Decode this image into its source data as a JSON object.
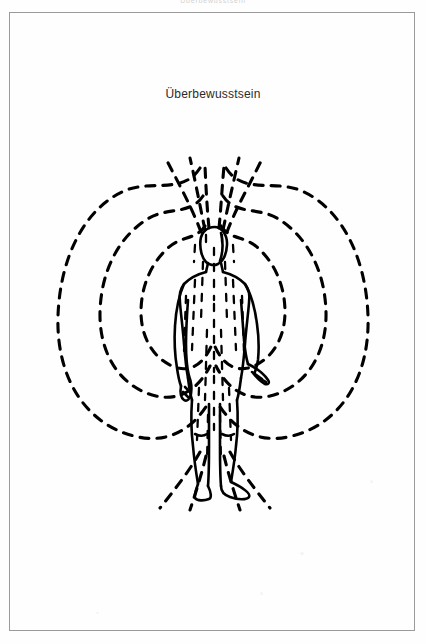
{
  "page": {
    "running_head": "Überbewusstsein",
    "background_color": "#fefefe",
    "frame_color": "#9a9a9a",
    "ink_color": "#000000"
  },
  "illustration": {
    "caption": "Überbewusstsein",
    "caption_color": "#2b2b2b",
    "subject": "standing-human-figure",
    "field_type": "toroidal-energy-field",
    "line_style": "dashed",
    "elements": [
      {
        "name": "human-figure",
        "description": "front-facing standing nude figure, arms at sides"
      },
      {
        "name": "aura-loop-inner-left",
        "description": "innermost dashed field loop, left side"
      },
      {
        "name": "aura-loop-middle-left",
        "description": "middle dashed field loop, left side"
      },
      {
        "name": "aura-loop-outer-left",
        "description": "outermost dashed field loop, left side"
      },
      {
        "name": "aura-loop-inner-right",
        "description": "innermost dashed field loop, right side"
      },
      {
        "name": "aura-loop-middle-right",
        "description": "middle dashed field loop, right side"
      },
      {
        "name": "aura-loop-outer-right",
        "description": "outermost dashed field loop, right side"
      },
      {
        "name": "crown-rays",
        "description": "dashed rays fountaining upward from the head"
      },
      {
        "name": "ground-rays",
        "description": "dashed rays radiating downward from the feet"
      },
      {
        "name": "body-energy-lines",
        "description": "vertical dashed lines filling the body"
      }
    ]
  }
}
